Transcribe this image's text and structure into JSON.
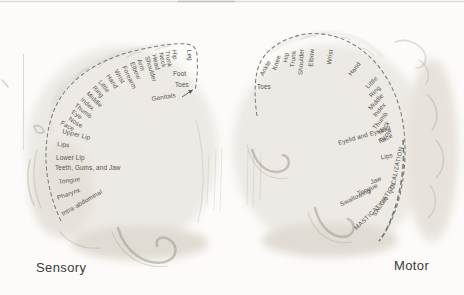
{
  "colors": {
    "background": "#fcfbf9",
    "label": "#57544e",
    "arc": "#7d7a74",
    "caption": "#3c3a36",
    "pencil": "#9a948a"
  },
  "sensory": {
    "caption": "Sensory",
    "labels": [
      {
        "text": "Genitals",
        "x": 152,
        "y": 101,
        "rot": -9
      },
      {
        "text": "Toes",
        "x": 175,
        "y": 87,
        "rot": 0
      },
      {
        "text": "Foot",
        "x": 173,
        "y": 76,
        "rot": 0
      },
      {
        "text": "Leg",
        "x": 187,
        "y": 50,
        "rot": 84
      },
      {
        "text": "Hip",
        "x": 172,
        "y": 50,
        "rot": 82
      },
      {
        "text": "Trunk",
        "x": 165,
        "y": 51,
        "rot": 80
      },
      {
        "text": "Neck",
        "x": 159,
        "y": 53,
        "rot": 78
      },
      {
        "text": "Head",
        "x": 152,
        "y": 55,
        "rot": 76
      },
      {
        "text": "Shoulder",
        "x": 145,
        "y": 57,
        "rot": 73
      },
      {
        "text": "Arm",
        "x": 137,
        "y": 60,
        "rot": 70
      },
      {
        "text": "Elbow",
        "x": 130,
        "y": 63,
        "rot": 67
      },
      {
        "text": "Forearm",
        "x": 122,
        "y": 67,
        "rot": 64
      },
      {
        "text": "Wrist",
        "x": 114,
        "y": 71,
        "rot": 60
      },
      {
        "text": "Hand",
        "x": 106,
        "y": 76,
        "rot": 56
      },
      {
        "text": "Little",
        "x": 98,
        "y": 82,
        "rot": 52
      },
      {
        "text": "Ring",
        "x": 92,
        "y": 88,
        "rot": 48
      },
      {
        "text": "Middle",
        "x": 86,
        "y": 94,
        "rot": 45
      },
      {
        "text": "Index",
        "x": 80,
        "y": 100,
        "rot": 42
      },
      {
        "text": "Thumb",
        "x": 74,
        "y": 106,
        "rot": 39
      },
      {
        "text": "Eye",
        "x": 71,
        "y": 113,
        "rot": 36
      },
      {
        "text": "Nose",
        "x": 68,
        "y": 120,
        "rot": 32
      },
      {
        "text": "Face",
        "x": 60,
        "y": 124,
        "rot": 30
      },
      {
        "text": "Upper Lip",
        "x": 62,
        "y": 133,
        "rot": 14
      },
      {
        "text": "Lips",
        "x": 57,
        "y": 146,
        "rot": 6
      },
      {
        "text": "Lower Lip",
        "x": 56,
        "y": 160,
        "rot": 0
      },
      {
        "text": "Teeth, Gums, and Jaw",
        "x": 55,
        "y": 170,
        "rot": 0
      },
      {
        "text": "Tongue",
        "x": 59,
        "y": 184,
        "rot": -8
      },
      {
        "text": "Pharynx",
        "x": 58,
        "y": 200,
        "rot": -20
      },
      {
        "text": "Intra-abdominal",
        "x": 63,
        "y": 216,
        "rot": -30
      }
    ]
  },
  "motor": {
    "caption": "Motor",
    "labels": [
      {
        "text": "Toes",
        "x": 257,
        "y": 89,
        "rot": 0
      },
      {
        "text": "Ankle",
        "x": 271,
        "y": 62,
        "rot": -62,
        "anchor": "end"
      },
      {
        "text": "Knee",
        "x": 281,
        "y": 56,
        "rot": -72,
        "anchor": "end"
      },
      {
        "text": "Hip",
        "x": 289,
        "y": 53,
        "rot": -80,
        "anchor": "end"
      },
      {
        "text": "Trunk",
        "x": 296,
        "y": 51,
        "rot": -84,
        "anchor": "end"
      },
      {
        "text": "Shoulder",
        "x": 304,
        "y": 49,
        "rot": -86,
        "anchor": "end"
      },
      {
        "text": "Elbow",
        "x": 314,
        "y": 49,
        "rot": -86,
        "anchor": "end"
      },
      {
        "text": "Wrist",
        "x": 333,
        "y": 50,
        "rot": -82,
        "anchor": "end"
      },
      {
        "text": "Hand",
        "x": 361,
        "y": 64,
        "rot": -52,
        "anchor": "end"
      },
      {
        "text": "Little",
        "x": 378,
        "y": 79,
        "rot": -45,
        "anchor": "end"
      },
      {
        "text": "Ring",
        "x": 381,
        "y": 88,
        "rot": -47,
        "anchor": "end"
      },
      {
        "text": "Middle",
        "x": 384,
        "y": 96,
        "rot": -48,
        "anchor": "end"
      },
      {
        "text": "Index",
        "x": 386,
        "y": 105,
        "rot": -50,
        "anchor": "end"
      },
      {
        "text": "Thumb",
        "x": 388,
        "y": 114,
        "rot": -52,
        "anchor": "end"
      },
      {
        "text": "Neck",
        "x": 390,
        "y": 123,
        "rot": -54,
        "anchor": "end"
      },
      {
        "text": "Brow",
        "x": 392,
        "y": 131,
        "rot": -51,
        "anchor": "end"
      },
      {
        "text": "Eyelid and Eyeball",
        "x": 391,
        "y": 130,
        "rot": -16,
        "anchor": "end"
      },
      {
        "text": "Face",
        "x": 393,
        "y": 137,
        "rot": -26,
        "anchor": "end"
      },
      {
        "text": "Lips",
        "x": 393,
        "y": 157,
        "rot": -12,
        "anchor": "end"
      },
      {
        "text": "VOCALIZATION",
        "x": 403,
        "y": 147,
        "rot": -78,
        "anchor": "end",
        "caps": true
      },
      {
        "text": "Jaw",
        "x": 382,
        "y": 180,
        "rot": -22,
        "anchor": "end"
      },
      {
        "text": "Tongue",
        "x": 378,
        "y": 187,
        "rot": -24,
        "anchor": "end"
      },
      {
        "text": "Swallowing",
        "x": 371,
        "y": 192,
        "rot": -26,
        "anchor": "end"
      },
      {
        "text": "SALIVATION",
        "x": 396,
        "y": 184,
        "rot": -58,
        "anchor": "end",
        "caps": true
      },
      {
        "text": "MASTICATION",
        "x": 389,
        "y": 199,
        "rot": -44,
        "anchor": "end",
        "caps": true
      }
    ]
  }
}
